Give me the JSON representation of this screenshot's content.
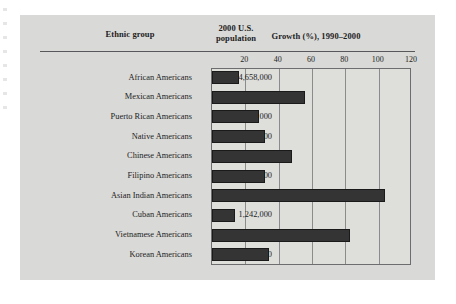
{
  "figure": {
    "headers": {
      "ethnic_group": "Ethnic group",
      "population_line1": "2000 U.S.",
      "population_line2": "population",
      "growth": "Growth (%), 1990–2000"
    },
    "colors": {
      "panel_background": "#d9d9d7",
      "plot_background": "#dededb",
      "bar_fill": "#343434",
      "bar_stroke": "#1a1a1a",
      "gridline": "#8b8b8d",
      "rule": "#58585a",
      "text": "#1d1d1d"
    }
  },
  "chart_data": {
    "type": "bar",
    "orientation": "horizontal",
    "title": "Growth (%), 1990–2000",
    "xlabel": "Growth (%), 1990–2000",
    "ylabel": "Ethnic group",
    "xlim": [
      0,
      120
    ],
    "ticks": [
      20,
      40,
      60,
      80,
      100,
      120
    ],
    "grid": true,
    "legend": "none",
    "categories": [
      "African Americans",
      "Mexican Americans",
      "Puerto Rican Americans",
      "Native Americans",
      "Chinese Americans",
      "Filipino Americans",
      "Asian Indian Americans",
      "Cuban Americans",
      "Vietnamese Americans",
      "Korean Americans"
    ],
    "values": [
      16,
      56,
      28,
      32,
      48,
      32,
      104,
      14,
      83,
      34
    ],
    "populations": [
      "34,658,000",
      "20,641,000",
      "3,406,000",
      "2,476,000",
      "2,433,000",
      "1,850,000",
      "1,679,000",
      "1,242,000",
      "1,123,000",
      "1,077,000"
    ]
  }
}
